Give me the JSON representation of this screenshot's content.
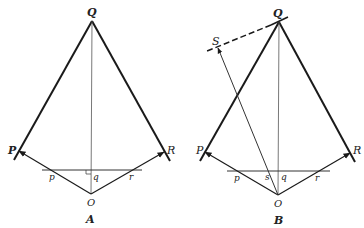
{
  "figures": [
    {
      "id": "A",
      "caption": "A",
      "points": {
        "Q": {
          "label": "Q",
          "x": 92,
          "y": 21
        },
        "P": {
          "label": "P",
          "x": 19,
          "y": 151
        },
        "R": {
          "label": "R",
          "x": 164,
          "y": 152
        },
        "O": {
          "label": "O",
          "x": 91,
          "y": 194
        }
      },
      "intersections": {
        "p": "p",
        "q": "q",
        "r": "r"
      },
      "has_right_angle_mark": true
    },
    {
      "id": "B",
      "caption": "B",
      "points": {
        "Q": {
          "label": "Q",
          "x": 279,
          "y": 22
        },
        "S": {
          "label": "S",
          "x": 218,
          "y": 48
        },
        "P": {
          "label": "P",
          "x": 205,
          "y": 152
        },
        "R": {
          "label": "R",
          "x": 350,
          "y": 153
        },
        "O": {
          "label": "O",
          "x": 278,
          "y": 195
        }
      },
      "intersections": {
        "p": "p",
        "s": "s",
        "q": "q",
        "r": "r"
      },
      "dashed_line": "tangent through Q toward S"
    }
  ],
  "colors": {
    "line": "#1a1a1a",
    "thin_line": "#555555",
    "background": "#ffffff"
  }
}
